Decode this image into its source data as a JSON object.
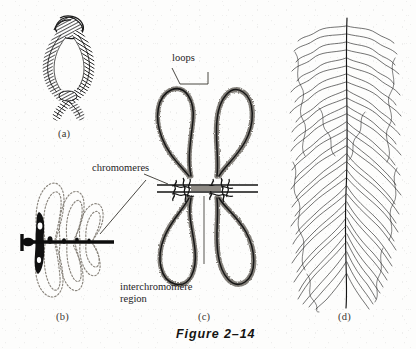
{
  "figure": {
    "caption": "Figure 2–14",
    "background_color": "#fdfdfc",
    "ink_color": "#1a1a1a"
  },
  "panels": [
    {
      "id": "a",
      "label": "(a)",
      "subject": "condensed lampbrush bivalent with two crossed chromatid strands forming a central open loop, drawn with dense cross-hatched chromatin texture"
    },
    {
      "id": "b",
      "label": "(b)",
      "subject": "chromosome axis drawn as a thick solid black line with a terminal knob, bearing dark irregular chromomere masses and pale outlined lateral loops extending above and below"
    },
    {
      "id": "c",
      "label": "(c)",
      "subject": "enlarged pair of chromomeres on the chromosome axis with four large lateral loops, each loop coated with fine radiating ribonucleoprotein transcript fibrils"
    },
    {
      "id": "d",
      "label": "(d)",
      "subject": "electron-microscope style tracing of a transcription unit, a central DNA axis with many lateral nascent RNA fibrils increasing in length along the axis"
    }
  ],
  "callouts": [
    {
      "id": "loops",
      "text": "loops",
      "style": "bracket-leader"
    },
    {
      "id": "chromomeres",
      "text": "chromomeres",
      "style": "line-leader"
    },
    {
      "id": "interchromomere-region",
      "line1": "interchromomere",
      "line2": "region",
      "style": "line-leader"
    }
  ]
}
